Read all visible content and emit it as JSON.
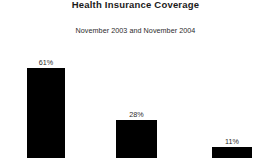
{
  "chart_data": {
    "type": "bar",
    "title": "Health Insurance Coverage",
    "subtitle": "November 2003 and November 2004",
    "categories": [
      "",
      "",
      ""
    ],
    "values": [
      61,
      28,
      11
    ],
    "value_labels": [
      "61%",
      "28%",
      "11%"
    ],
    "xlabel": "",
    "ylabel": "",
    "ylim": [
      0,
      100
    ],
    "grid": false,
    "legend": false,
    "bar_color": "#000000",
    "background_color": "#ffffff",
    "note": "bars are cropped at the bottom edge of the image; no axis or category labels visible"
  },
  "bars": [
    {
      "label": "61%",
      "value": 61,
      "left": 27,
      "width": 38,
      "top": 68
    },
    {
      "label": "28%",
      "value": 28,
      "left": 116,
      "width": 41,
      "top": 120
    },
    {
      "label": "11%",
      "value": 11,
      "left": 212,
      "width": 40,
      "top": 147
    }
  ]
}
